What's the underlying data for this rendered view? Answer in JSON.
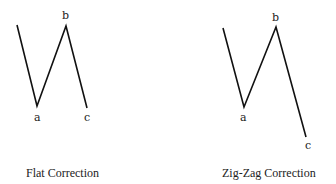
{
  "diagrams": [
    {
      "caption": "Flat Correction",
      "points": {
        "start": [
          17,
          25
        ],
        "a": [
          37,
          106
        ],
        "b": [
          66,
          26
        ],
        "c": [
          87,
          108
        ]
      },
      "labels": {
        "a": "a",
        "b": "b",
        "c": "c"
      }
    },
    {
      "caption": "Zig-Zag Correction",
      "points": {
        "start": [
          223,
          28
        ],
        "a": [
          244,
          107
        ],
        "b": [
          276,
          27
        ],
        "c": [
          306,
          137
        ]
      },
      "labels": {
        "a": "a",
        "b": "b",
        "c": "c"
      }
    }
  ],
  "colors": {
    "line": "#111111",
    "text": "#222222",
    "background": "#ffffff"
  }
}
